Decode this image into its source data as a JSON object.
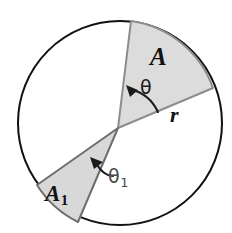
{
  "figure": {
    "background_color": "#ffffff",
    "circle": {
      "cx": 120,
      "cy": 123,
      "r": 102,
      "stroke_color": "#111111",
      "stroke_width": 2.0,
      "fill_color": "#ffffff"
    },
    "vertex": {
      "x": 118,
      "y": 128
    },
    "sectors": [
      {
        "name": "A",
        "label": "A",
        "fill_color": "#dcdcdc",
        "stroke_color": "#8c8c8c",
        "stroke_width": 2.0,
        "start_point": {
          "x": 131,
          "y": 21
        },
        "end_point": {
          "x": 213,
          "y": 88
        },
        "angle_symbol": "θ"
      },
      {
        "name": "A1",
        "label": "A",
        "label_subscript": "1",
        "fill_color": "#d8d8d8",
        "stroke_color": "#6e6e6e",
        "stroke_width": 2.0,
        "start_point": {
          "x": 37,
          "y": 185
        },
        "end_point": {
          "x": 78,
          "y": 222
        },
        "angle_symbol": "θ",
        "angle_subscript": "1"
      }
    ],
    "radius_label": "r",
    "theta_label": "θ",
    "theta1_label": "θ",
    "theta1_subscript": "1",
    "colors": {
      "outline": "#111111",
      "sector_fill": "#dcdcdc",
      "sector_edge": "#8c8c8c",
      "label_dark": "#111111",
      "label_gray": "#4a4a4a"
    }
  }
}
